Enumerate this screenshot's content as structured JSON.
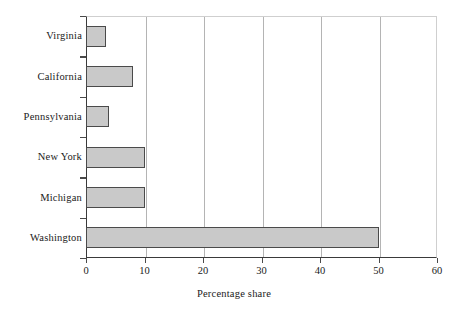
{
  "chart_data": {
    "type": "bar",
    "orientation": "horizontal",
    "title": "",
    "xlabel": "Percentage share",
    "ylabel": "",
    "categories": [
      "Washington",
      "Michigan",
      "New York",
      "Pennsylvania",
      "California",
      "Virginia"
    ],
    "values": [
      50,
      10,
      10,
      4,
      8,
      3.5
    ],
    "xlim": [
      0,
      60
    ],
    "xticks": [
      0,
      10,
      20,
      30,
      40,
      50,
      60
    ],
    "xtick_labels": [
      "0",
      "10",
      "20",
      "30",
      "40",
      "50",
      "60"
    ],
    "grid": "vertical",
    "legend": "none",
    "bar_fill": "#c9c9c9",
    "bar_edge": "#4a4a4a",
    "axis_color": "#3a3a3a",
    "grid_color": "#b4b4b4"
  }
}
